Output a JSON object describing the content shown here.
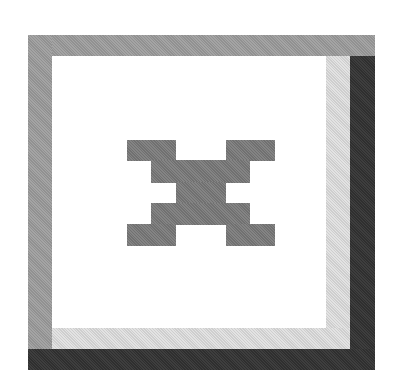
{
  "button": {
    "role": "move-button",
    "icon": "move-arrows-icon",
    "state": "raised",
    "colors": {
      "face": "#ffffff",
      "highlight_outer": "#9a9a9a",
      "shadow_inner": "#d9d9d9",
      "shadow_outer": "#343434",
      "glyph": "#7a7a7a"
    }
  }
}
